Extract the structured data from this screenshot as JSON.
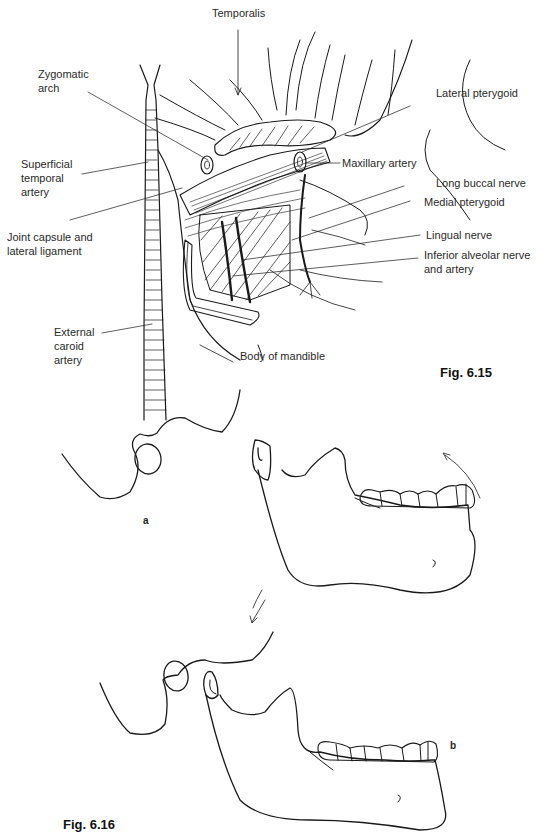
{
  "header": {
    "running_text": ""
  },
  "figure_6_15": {
    "caption": "Fig. 6.15",
    "labels": {
      "temporalis": "Temporalis",
      "zygomatic_arch_1": "Zygomatic",
      "zygomatic_arch_2": "arch",
      "superficial_temporal_1": "Superficial",
      "superficial_temporal_2": "temporal",
      "superficial_temporal_3": "artery",
      "joint_capsule_1": "Joint capsule and",
      "joint_capsule_2": "lateral ligament",
      "external_carotid_1": "External",
      "external_carotid_2": "caroid",
      "external_carotid_3": "artery",
      "body_of_mandible": "Body of mandible",
      "lateral_pterygoid": "Lateral pterygoid",
      "maxillary_artery": "Maxillary artery",
      "long_buccal_nerve": "Long buccal nerve",
      "medial_pterygoid": "Medial pterygoid",
      "lingual_nerve": "Lingual nerve",
      "inferior_alveolar_1": "Inferior alveolar nerve",
      "inferior_alveolar_2": "and artery"
    }
  },
  "figure_6_16": {
    "caption": "Fig. 6.16",
    "panel_a": "a",
    "panel_b": "b"
  }
}
